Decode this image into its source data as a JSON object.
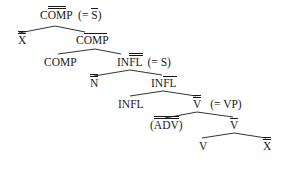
{
  "diagram": {
    "type": "syntax-tree",
    "nodes": {
      "root": {
        "label": "COMP",
        "bars": 2,
        "bar_span": "OM",
        "annotation": "(= S̄)",
        "annotation_cat": "S",
        "annotation_bars": 1
      },
      "spec_root": {
        "label": "X",
        "bars": 2
      },
      "comp_bar": {
        "label": "COMP",
        "bars": 1,
        "bar_span": "OMP"
      },
      "comp_head": {
        "label": "COMP",
        "bars": 0
      },
      "infl_max": {
        "label": "INFL",
        "bars": 2,
        "bar_span": "FL",
        "annotation": "(= S)"
      },
      "spec_infl": {
        "label": "N",
        "bars": 2
      },
      "infl_bar": {
        "label": "INFL",
        "bars": 1,
        "bar_span": "FL"
      },
      "infl_head": {
        "label": "INFL",
        "bars": 0
      },
      "v_max": {
        "label": "V",
        "bars": 2,
        "annotation": "(= VP)"
      },
      "adv": {
        "label": "ADV",
        "bars": 2,
        "prefix": "(",
        "suffix": ")"
      },
      "v_bar": {
        "label": "V",
        "bars": 1
      },
      "v_head": {
        "label": "V",
        "bars": 0
      },
      "complement": {
        "label": "X",
        "bars": 2
      }
    },
    "edges": [
      [
        "root",
        "spec_root"
      ],
      [
        "root",
        "comp_bar"
      ],
      [
        "comp_bar",
        "comp_head"
      ],
      [
        "comp_bar",
        "infl_max"
      ],
      [
        "infl_max",
        "spec_infl"
      ],
      [
        "infl_max",
        "infl_bar"
      ],
      [
        "infl_bar",
        "infl_head"
      ],
      [
        "infl_bar",
        "v_max"
      ],
      [
        "v_max",
        "adv"
      ],
      [
        "v_max",
        "v_bar"
      ],
      [
        "v_bar",
        "v_head"
      ],
      [
        "v_bar",
        "complement"
      ]
    ]
  },
  "text": {
    "root_pre": "C",
    "root_bar": "OM",
    "root_post": "P",
    "root_ann_open": "(= ",
    "root_ann_cat": "S",
    "root_ann_close": ")",
    "spec_root": "X",
    "comp_bar_pre": "C",
    "comp_bar_bar": "OMP",
    "comp_head": "COMP",
    "infl_max_pre": "IN",
    "infl_max_bar": "FL",
    "infl_max_ann": "(= S)",
    "spec_infl": "N",
    "infl_bar_pre": "IN",
    "infl_bar_bar": "FL",
    "infl_head": "INFL",
    "v_max": "V",
    "v_max_ann": "(= VP)",
    "adv_open": "(",
    "adv": "ADV",
    "adv_close": ")",
    "v_bar": "V",
    "v_head": "V",
    "complement": "X"
  }
}
